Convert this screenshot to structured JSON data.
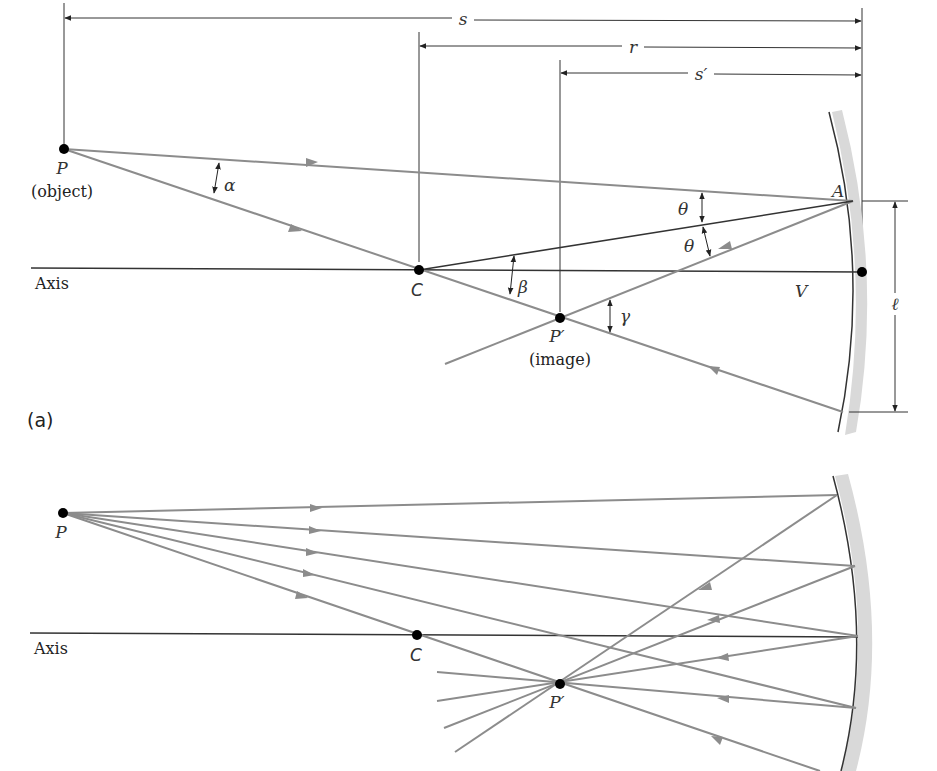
{
  "figure": {
    "panel_a": {
      "label": "(a)",
      "dimensions": {
        "s": "s",
        "r": "r",
        "s_prime": "s′",
        "ell": "ℓ"
      },
      "points": {
        "P": "P",
        "P_caption": "(object)",
        "C": "C",
        "P_prime": "P′",
        "P_prime_caption": "(image)",
        "V": "V",
        "A": "A"
      },
      "angles": {
        "alpha": "α",
        "beta": "β",
        "gamma": "γ",
        "theta1": "θ",
        "theta2": "θ"
      },
      "axis_label": "Axis"
    },
    "panel_b": {
      "points": {
        "P": "P",
        "C": "C",
        "P_prime": "P′"
      },
      "axis_label": "Axis"
    },
    "colors": {
      "ray": "#8c8c8c",
      "line": "#333333",
      "mirror_back": "#d9d9d9",
      "point": "#000000"
    }
  }
}
